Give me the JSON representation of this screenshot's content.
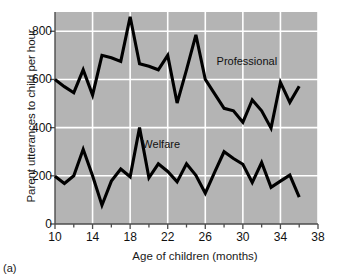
{
  "figure": {
    "caption": "(a)",
    "plot_bg_color": "#b4b4b4",
    "grid_color": "#ffffff",
    "line_color": "#000000"
  },
  "chart_data": {
    "type": "line",
    "title": "",
    "xlabel": "Age of children (months)",
    "ylabel": "Parent utterances to child per hour",
    "xlim": [
      10,
      38
    ],
    "ylim": [
      0,
      880
    ],
    "xticks": [
      10,
      14,
      18,
      22,
      26,
      30,
      34,
      38
    ],
    "xticks_minor": [
      12,
      16,
      20,
      24,
      28,
      32,
      36
    ],
    "yticks": [
      0,
      200,
      400,
      600,
      800
    ],
    "grid": true,
    "legend_position": "inline-annotation",
    "x": [
      10,
      11,
      12,
      13,
      14,
      15,
      16,
      17,
      18,
      19,
      20,
      21,
      22,
      23,
      24,
      25,
      26,
      27,
      28,
      29,
      30,
      31,
      32,
      33,
      34,
      35,
      36
    ],
    "series": [
      {
        "name": "Professional",
        "label_x": 27.2,
        "label_y": 672,
        "values": [
          600,
          570,
          545,
          640,
          535,
          700,
          690,
          675,
          860,
          665,
          655,
          640,
          700,
          502,
          640,
          785,
          600,
          540,
          480,
          470,
          422,
          515,
          470,
          398,
          588,
          505,
          572
        ]
      },
      {
        "name": "Welfare",
        "label_x": 19.3,
        "label_y": 330,
        "values": [
          198,
          168,
          200,
          310,
          200,
          78,
          178,
          228,
          196,
          400,
          192,
          250,
          218,
          175,
          250,
          202,
          128,
          215,
          300,
          272,
          248,
          172,
          255,
          152,
          178,
          203,
          112
        ]
      }
    ]
  }
}
